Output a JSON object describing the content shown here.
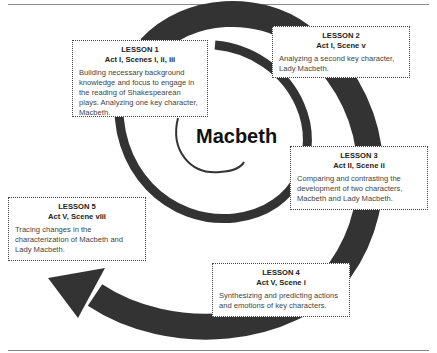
{
  "title": "Macbeth",
  "lessons": [
    {
      "label": "LESSON 1",
      "scene": "Act I, Scenes i, ii, iii",
      "description": "Building necessary background knowledge and focus to engage in the reading of Shakespearean plays. Analyzing one key character, Macbeth."
    },
    {
      "label": "LESSON 2",
      "scene": "Act I, Scene v",
      "description": "Analyzing a second key character, Lady Macbeth."
    },
    {
      "label": "LESSON 3",
      "scene": "Act II, Scene ii",
      "description": "Comparing and contrasting the development of two characters, Macbeth and Lady Macbeth."
    },
    {
      "label": "LESSON 4",
      "scene": "Act V, Scene i",
      "description": "Synthesizing and predicting actions and emotions of key characters."
    },
    {
      "label": "LESSON 5",
      "scene": "Act V, Scene viii",
      "description": "Tracing changes in the characterization of Macbeth and Lady Macbeth."
    }
  ],
  "colors": {
    "spiral": "#333333",
    "border": "#444444",
    "rule": "#888888"
  }
}
